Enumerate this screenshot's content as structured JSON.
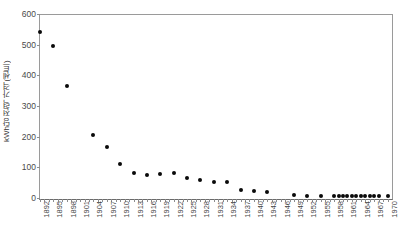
{
  "chart_data": {
    "type": "scatter",
    "title": "",
    "subtitle": "",
    "xlabel": "",
    "ylabel": "kWh당 전력 가격(센트)",
    "ylabel_chars": [
      "k",
      "W",
      "h",
      "당",
      "전",
      "력",
      " ",
      "가",
      "격",
      "(",
      "센",
      "트",
      ")"
    ],
    "xlim": [
      1892,
      1971
    ],
    "ylim": [
      0,
      600
    ],
    "y_ticks": [
      0,
      100,
      200,
      300,
      400,
      500,
      600
    ],
    "x_tick_labels": [
      "1892",
      "1895",
      "1898",
      "1901",
      "1904",
      "1907",
      "1910",
      "1913",
      "1916",
      "1919",
      "1922",
      "1925",
      "1928",
      "1931",
      "1934",
      "1937",
      "1940",
      "1943",
      "1946",
      "1949",
      "1952",
      "1955",
      "1958",
      "1961",
      "1964",
      "1967",
      "1970"
    ],
    "x_tick_interval": 3,
    "grid": false,
    "legend": false,
    "marker_color": "#0a0a0a",
    "axis_color": "#8d8d8d",
    "points": [
      {
        "x": 1892,
        "y": 545
      },
      {
        "x": 1895,
        "y": 500
      },
      {
        "x": 1898,
        "y": 370
      },
      {
        "x": 1904,
        "y": 210
      },
      {
        "x": 1907,
        "y": 170
      },
      {
        "x": 1910,
        "y": 113
      },
      {
        "x": 1913,
        "y": 86
      },
      {
        "x": 1916,
        "y": 78
      },
      {
        "x": 1919,
        "y": 80
      },
      {
        "x": 1922,
        "y": 84
      },
      {
        "x": 1925,
        "y": 68
      },
      {
        "x": 1928,
        "y": 63
      },
      {
        "x": 1931,
        "y": 55
      },
      {
        "x": 1934,
        "y": 56
      },
      {
        "x": 1937,
        "y": 30
      },
      {
        "x": 1940,
        "y": 27
      },
      {
        "x": 1943,
        "y": 22
      },
      {
        "x": 1949,
        "y": 12
      },
      {
        "x": 1952,
        "y": 11
      },
      {
        "x": 1955,
        "y": 11
      },
      {
        "x": 1958,
        "y": 11
      },
      {
        "x": 1959,
        "y": 11
      },
      {
        "x": 1960,
        "y": 11
      },
      {
        "x": 1961,
        "y": 11
      },
      {
        "x": 1962,
        "y": 11
      },
      {
        "x": 1963,
        "y": 11
      },
      {
        "x": 1964,
        "y": 11
      },
      {
        "x": 1965,
        "y": 11
      },
      {
        "x": 1966,
        "y": 10
      },
      {
        "x": 1967,
        "y": 10
      },
      {
        "x": 1968,
        "y": 10
      },
      {
        "x": 1970,
        "y": 9
      }
    ]
  }
}
